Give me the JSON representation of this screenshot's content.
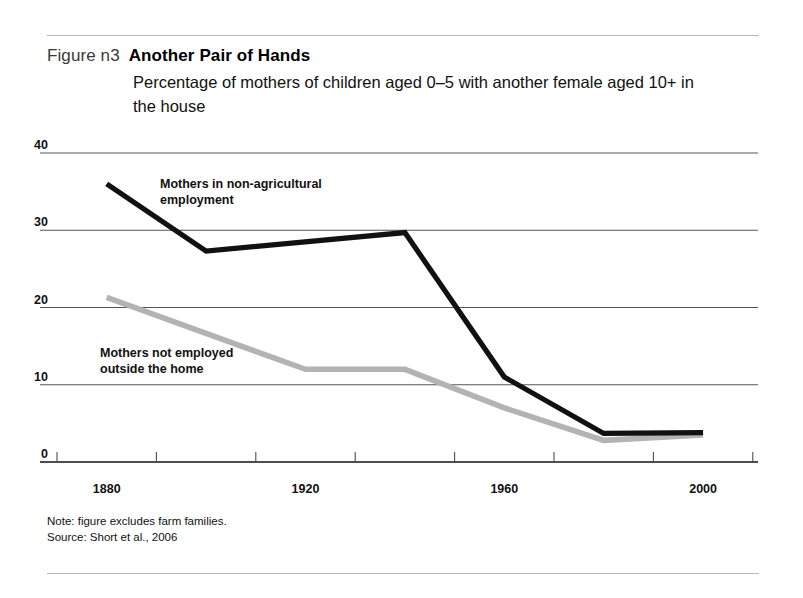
{
  "figure": {
    "label": "Figure n3",
    "title": "Another Pair of Hands",
    "subtitle": "Percentage of mothers of children aged 0–5 with another female aged 10+ in the house",
    "note": "Note: figure excludes farm families.",
    "source": "Source: Short et al., 2006"
  },
  "colors": {
    "series_black": "#111111",
    "series_gray": "#b3b3b3",
    "gridline": "#4d4d4d",
    "rule": "#b9b9b9",
    "text": "#111111"
  },
  "chart_data": {
    "type": "line",
    "title": "Another Pair of Hands",
    "subtitle": "Percentage of mothers of children aged 0–5 with another female aged 10+ in the house",
    "xlabel": "",
    "ylabel": "",
    "xlim": [
      1870,
      2010
    ],
    "ylim": [
      0,
      40
    ],
    "yticks": [
      0,
      10,
      20,
      30,
      40
    ],
    "ytick_labels": [
      "0",
      "10",
      "20",
      "30",
      "40"
    ],
    "xticks": [
      1870,
      1890,
      1910,
      1930,
      1950,
      1970,
      1990,
      2010
    ],
    "xtick_labels_shown": [
      "1880",
      "1920",
      "1960",
      "2000"
    ],
    "xtick_labels_shown_values": [
      1880,
      1920,
      1960,
      2000
    ],
    "grid": "horizontal",
    "legend_position": "inline-annotations",
    "series": [
      {
        "name": "Mothers in non-agricultural employment",
        "color": "#111111",
        "annotation": "Mothers in non-agricultural\nemployment",
        "x": [
          1880,
          1900,
          1940,
          1960,
          1980,
          2000
        ],
        "values": [
          36.0,
          27.3,
          29.7,
          11.0,
          3.7,
          3.8
        ]
      },
      {
        "name": "Mothers not employed outside the home",
        "color": "#b3b3b3",
        "annotation": "Mothers not employed\noutside the home",
        "x": [
          1880,
          1920,
          1940,
          1960,
          1980,
          2000
        ],
        "values": [
          21.3,
          12.0,
          12.0,
          7.0,
          2.8,
          3.5
        ]
      }
    ]
  }
}
